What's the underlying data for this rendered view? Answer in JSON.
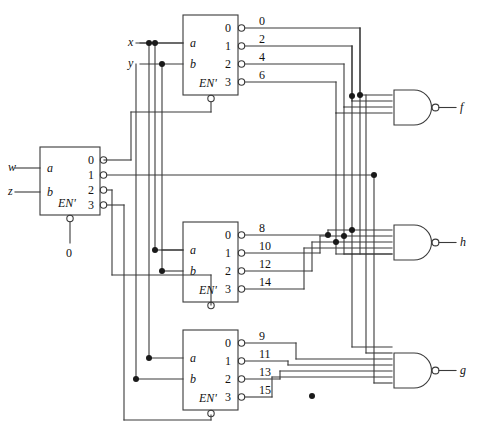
{
  "diagram": {
    "stroke_color": "#3a3a3a",
    "text_color": "#111111"
  },
  "inputs": [
    {
      "name": "input-w",
      "label": "w",
      "x": 8,
      "y": 160
    },
    {
      "name": "input-z",
      "label": "z",
      "x": 8,
      "y": 186
    },
    {
      "name": "input-x",
      "label": "x",
      "x": 128,
      "y": 38
    },
    {
      "name": "input-y",
      "label": "y",
      "x": 128,
      "y": 59
    }
  ],
  "decoders": [
    {
      "name": "decoder-top",
      "port_a": "a",
      "port_b": "b",
      "enable": "EN'",
      "index_labels": [
        "0",
        "1",
        "2",
        "3"
      ],
      "output_labels": [
        "0",
        "2",
        "4",
        "6"
      ]
    },
    {
      "name": "decoder-left",
      "port_a": "a",
      "port_b": "b",
      "enable": "EN'",
      "enable_value": "0",
      "index_labels": [
        "0",
        "1",
        "2",
        "3"
      ],
      "output_labels": [
        "",
        "",
        "",
        ""
      ]
    },
    {
      "name": "decoder-middle",
      "port_a": "a",
      "port_b": "b",
      "enable": "EN'",
      "index_labels": [
        "0",
        "1",
        "2",
        "3"
      ],
      "output_labels": [
        "8",
        "10",
        "12",
        "14"
      ]
    },
    {
      "name": "decoder-bottom",
      "port_a": "a",
      "port_b": "b",
      "enable": "EN'",
      "index_labels": [
        "0",
        "1",
        "2",
        "3"
      ],
      "output_labels": [
        "9",
        "11",
        "13",
        "15"
      ]
    }
  ],
  "gates": [
    {
      "name": "nand-gate-f",
      "type": "NAND",
      "output_label": "f",
      "input_count": 6
    },
    {
      "name": "nand-gate-h",
      "type": "NAND",
      "output_label": "h",
      "input_count": 6
    },
    {
      "name": "nand-gate-g",
      "type": "NAND",
      "output_label": "g",
      "input_count": 6
    }
  ],
  "constants": [
    {
      "name": "enable-constant-zero",
      "label": "0"
    }
  ]
}
